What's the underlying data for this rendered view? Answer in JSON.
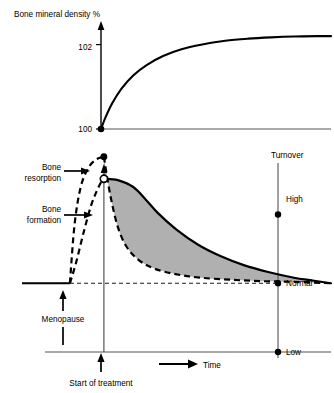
{
  "figure": {
    "background": "#ffffff",
    "ink": "#000000",
    "axis_color": "#555555",
    "fill_gray": "#b0b0b0"
  },
  "top_panel": {
    "title": "Bone mineral density %",
    "y_ticks": [
      "102",
      "100"
    ],
    "origin_marker": "filled-dot"
  },
  "bottom_panel": {
    "right_axis_title": "Turnover",
    "right_ticks": [
      "High",
      "Normal",
      "Low"
    ],
    "x_axis_label": "Time",
    "annotations": {
      "resorption_line1": "Bone",
      "resorption_line2": "resorption",
      "formation_line1": "Bone",
      "formation_line2": "formation",
      "menopause": "Menopause",
      "start_treatment": "Start of treatment"
    }
  },
  "chart_data": [
    {
      "type": "line",
      "id": "bone-mineral-density",
      "title": "Bone mineral density %",
      "xlabel": "",
      "ylabel": "Bone mineral density %",
      "grid": false,
      "legend": "none",
      "ylim": [
        100,
        102.4
      ],
      "ytick_values": [
        100,
        102
      ],
      "ytick_labels": [
        "100",
        "102"
      ],
      "xlim": [
        0,
        100
      ],
      "series": [
        {
          "name": "Bone mineral density",
          "style": "solid",
          "x": [
            0,
            2,
            5,
            9,
            14,
            20,
            27,
            35,
            44,
            54,
            64,
            74,
            84,
            94,
            100
          ],
          "y": [
            100.0,
            100.28,
            100.62,
            100.96,
            101.27,
            101.52,
            101.73,
            101.89,
            102.0,
            102.09,
            102.14,
            102.17,
            102.19,
            102.2,
            102.2
          ]
        }
      ],
      "markers": [
        {
          "name": "origin-dot",
          "x": 0,
          "y": 100.0,
          "style": "filled"
        }
      ]
    },
    {
      "type": "line",
      "id": "bone-turnover",
      "title": "",
      "xlabel": "Time",
      "ylabel": "Turnover",
      "grid": false,
      "legend": "none",
      "ylim": [
        0,
        3.1
      ],
      "ytick_values": [
        2.0,
        1.0,
        0.0
      ],
      "ytick_labels": [
        "High",
        "Normal",
        "Low"
      ],
      "xlim": [
        0,
        100
      ],
      "reference_lines": [
        {
          "name": "normal-level",
          "y": 1.0,
          "style": "dashed-thin"
        }
      ],
      "events": [
        {
          "name": "menopause",
          "x": 15.5,
          "label": "Menopause"
        },
        {
          "name": "start-of-treatment",
          "x": 26.5,
          "label": "Start of treatment"
        }
      ],
      "series": [
        {
          "name": "Baseline (pre-menopause)",
          "style": "solid",
          "x": [
            0,
            15.5
          ],
          "y": [
            1.0,
            1.0
          ]
        },
        {
          "name": "Bone resorption",
          "style": "dashed",
          "x": [
            15.5,
            17,
            19,
            21.5,
            24,
            26.5
          ],
          "y": [
            1.0,
            1.85,
            2.4,
            2.68,
            2.8,
            2.84
          ]
        },
        {
          "name": "Bone formation",
          "style": "dashed",
          "x": [
            15.5,
            17.5,
            20,
            22.5,
            25,
            26.5
          ],
          "y": [
            1.0,
            1.3,
            1.75,
            2.15,
            2.42,
            2.52
          ]
        },
        {
          "name": "Bone resorption (post-treatment)",
          "style": "dashed",
          "x": [
            26.5,
            28.5,
            31,
            34,
            38,
            43,
            50,
            58,
            68,
            78,
            88,
            100
          ],
          "y": [
            2.84,
            2.3,
            1.82,
            1.52,
            1.33,
            1.21,
            1.13,
            1.08,
            1.05,
            1.03,
            1.02,
            1.0
          ]
        },
        {
          "name": "Bone formation (post-treatment)",
          "style": "solid",
          "x": [
            26.5,
            31,
            36,
            40,
            44,
            50,
            57,
            64,
            72,
            80,
            88,
            94,
            100
          ],
          "y": [
            2.52,
            2.5,
            2.4,
            2.22,
            2.02,
            1.78,
            1.56,
            1.4,
            1.26,
            1.16,
            1.08,
            1.04,
            1.0
          ]
        }
      ],
      "markers": [
        {
          "name": "resorption-peak",
          "x": 26.5,
          "y": 2.84,
          "style": "filled"
        },
        {
          "name": "treatment-start-point",
          "x": 26.5,
          "y": 2.52,
          "style": "open"
        }
      ],
      "shaded_region": {
        "name": "turnover-gap",
        "between": [
          "Bone formation (post-treatment)",
          "Bone resorption (post-treatment)"
        ],
        "color": "#b0b0b0"
      }
    }
  ]
}
